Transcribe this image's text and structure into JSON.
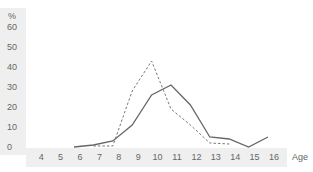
{
  "chart_data": {
    "type": "line",
    "title": "",
    "xlabel": "Age",
    "ylabel": "%",
    "ylim": [
      0,
      60
    ],
    "yticks": [
      0,
      10,
      20,
      30,
      40,
      50,
      60
    ],
    "categories": [
      "4",
      "5",
      "6",
      "7",
      "8",
      "9",
      "10",
      "11",
      "12",
      "13",
      "14",
      "15",
      "16"
    ],
    "grid": false,
    "legend": null,
    "series": [
      {
        "name": "solid",
        "style": "solid",
        "color": "#666666",
        "x": [
          6,
          7,
          8,
          9,
          10,
          11,
          12,
          13,
          14,
          15,
          16
        ],
        "values": [
          0,
          1,
          3,
          11,
          26,
          31,
          21,
          5,
          4,
          0,
          5
        ]
      },
      {
        "name": "dashed",
        "style": "dashed",
        "color": "#777777",
        "x": [
          7,
          8,
          9,
          10,
          11,
          12,
          13,
          14
        ],
        "values": [
          0.5,
          0.5,
          28,
          43,
          19,
          11,
          2,
          1.5
        ]
      }
    ]
  },
  "axis": {
    "y_unit": "%",
    "x_unit": "Age",
    "band_color": "#efefef"
  }
}
